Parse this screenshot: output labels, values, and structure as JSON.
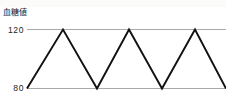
{
  "figure": {
    "name": "blood-glucose-zigzag-figure",
    "width": 226,
    "height": 108,
    "background_color": "#ffffff"
  },
  "axis": {
    "title": "血糖値",
    "tick_high": "120",
    "tick_low": "80"
  },
  "colors": {
    "gridline": "#a9a9a9",
    "series": "#111111",
    "text": "#1a1a1a",
    "background": "#ffffff"
  },
  "chart_data": {
    "type": "line",
    "title": "血糖値",
    "xlabel": "",
    "ylabel": "血糖値",
    "grid": true,
    "legend": "none",
    "ylim": [
      80,
      120
    ],
    "yticks": [
      80,
      120
    ],
    "ytick_labels": [
      "80",
      "120"
    ],
    "xlim": [
      0,
      199
    ],
    "xticks": [],
    "gridlines_y": [
      80,
      120
    ],
    "series": [
      {
        "name": "血糖値",
        "color": "#111111",
        "x": [
          0,
          36,
          70,
          102,
          135,
          168,
          199
        ],
        "values": [
          80,
          120,
          80,
          120,
          80,
          120,
          80
        ]
      }
    ]
  },
  "geometry": {
    "plot_left": 27,
    "plot_right": 226,
    "y_at_120": 29.5,
    "y_at_80": 88.5,
    "points_px": [
      [
        27,
        88.5
      ],
      [
        63,
        29.5
      ],
      [
        97,
        88.5
      ],
      [
        129,
        29.5
      ],
      [
        162,
        88.5
      ],
      [
        195,
        29.5
      ],
      [
        226,
        88.5
      ]
    ]
  }
}
